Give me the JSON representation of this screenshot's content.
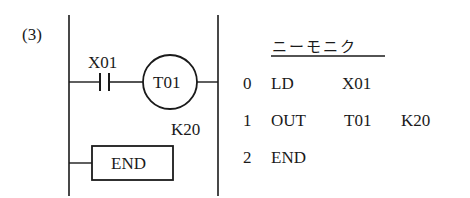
{
  "figure": {
    "label": "(3)"
  },
  "ladder": {
    "contact": {
      "label": "X01",
      "type": "normally-open"
    },
    "coil": {
      "label": "T01",
      "setting": "K20"
    },
    "end_box": {
      "label": "END"
    }
  },
  "mnemonic": {
    "title": "ニーモニク",
    "rows": [
      {
        "step": "0",
        "instruction": "LD",
        "operand": "X01",
        "param": ""
      },
      {
        "step": "1",
        "instruction": "OUT",
        "operand": "T01",
        "param": "K20"
      },
      {
        "step": "2",
        "instruction": "END",
        "operand": "",
        "param": ""
      }
    ]
  },
  "colors": {
    "ink": "#1a1a1a",
    "background": "#ffffff"
  }
}
